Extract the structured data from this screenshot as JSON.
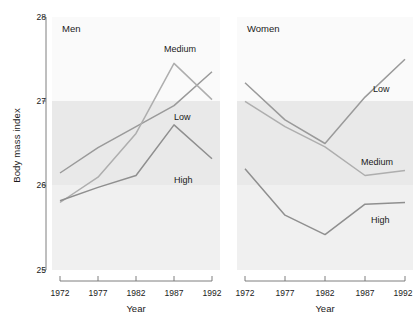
{
  "chart_data": {
    "type": "line",
    "title": "",
    "xlabel": "Year",
    "ylabel": "Body mass index",
    "x": [
      1972,
      1977,
      1982,
      1987,
      1992
    ],
    "xtick_labels": [
      "1972",
      "1977",
      "1982",
      "1987",
      "1992"
    ],
    "ytick_labels": [
      "25",
      "26",
      "27",
      "28"
    ],
    "ylim": [
      25,
      28
    ],
    "xlim": [
      1972,
      1992
    ],
    "grid": false,
    "legend_position": "inline-end-of-line",
    "panels": [
      {
        "name": "Men",
        "label": "Men",
        "series": [
          {
            "name": "Low",
            "label": "Low",
            "values": [
              26.15,
              26.45,
              26.7,
              26.95,
              27.35
            ]
          },
          {
            "name": "Medium",
            "label": "Medium",
            "values": [
              25.8,
              26.1,
              26.62,
              27.45,
              27.02
            ]
          },
          {
            "name": "High",
            "label": "High",
            "values": [
              25.82,
              25.98,
              26.12,
              26.72,
              26.32
            ]
          }
        ]
      },
      {
        "name": "Women",
        "label": "Women",
        "series": [
          {
            "name": "Low",
            "label": "Low",
            "values": [
              27.22,
              26.78,
              26.5,
              27.05,
              27.5
            ]
          },
          {
            "name": "Medium",
            "label": "Medium",
            "values": [
              27.0,
              26.7,
              26.46,
              26.12,
              26.18
            ]
          },
          {
            "name": "High",
            "label": "High",
            "values": [
              26.2,
              25.65,
              25.42,
              25.78,
              25.8
            ]
          }
        ]
      }
    ],
    "bands": [
      {
        "name": "upper-band",
        "from": 27,
        "to": 28,
        "color": "#fafafa"
      },
      {
        "name": "middle-band",
        "from": 26,
        "to": 27,
        "color": "#e9e9e9"
      },
      {
        "name": "lower-band",
        "from": 25,
        "to": 26,
        "color": "#f0f0f0"
      }
    ],
    "colors": {
      "line_low": "#9a9a9a",
      "line_medium": "#a8a8a8",
      "line_high": "#8f8f8f",
      "axis": "#6f6f6f",
      "text": "#1a1a1a"
    }
  }
}
